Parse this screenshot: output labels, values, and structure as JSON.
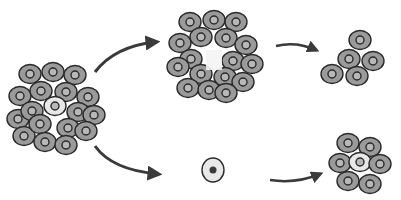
{
  "diagram": {
    "type": "cell-differentiation-illustration",
    "colors": {
      "cell_fill": "#9a9a9a",
      "cell_stroke": "#2a2a2a",
      "nucleus_fill": "#b8b8b8",
      "highlight_cell": "#e8e8e8",
      "arrow": "#3a3a3a",
      "background": "#ffffff"
    },
    "clusters": [
      {
        "id": "origin-cluster",
        "label": ""
      },
      {
        "id": "ring-cluster",
        "label": ""
      },
      {
        "id": "small-cluster-top",
        "label": ""
      },
      {
        "id": "single-cell",
        "label": ""
      },
      {
        "id": "small-cluster-bottom",
        "label": ""
      }
    ],
    "arrows": [
      {
        "from": "origin-cluster",
        "to": "ring-cluster"
      },
      {
        "from": "origin-cluster",
        "to": "single-cell"
      },
      {
        "from": "ring-cluster",
        "to": "small-cluster-top"
      },
      {
        "from": "single-cell",
        "to": "small-cluster-bottom"
      }
    ]
  }
}
